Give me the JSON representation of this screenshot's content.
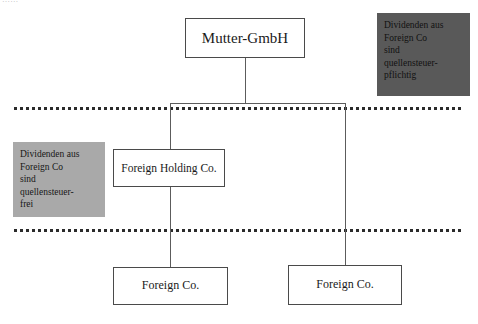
{
  "diagram": {
    "top_fragment_text": "……",
    "entities": [
      {
        "id": "mutter",
        "label": "Mutter-GmbH"
      },
      {
        "id": "holding",
        "label": "Foreign Holding Co."
      },
      {
        "id": "foreign_left",
        "label": "Foreign Co."
      },
      {
        "id": "foreign_right",
        "label": "Foreign Co."
      }
    ],
    "notes": [
      {
        "id": "withholding_taxable",
        "text": "Dividenden aus\nForeign Co\nsind\nquellensteuer-\npflichtig",
        "background": "#595959"
      },
      {
        "id": "withholding_free",
        "text": "Dividenden aus\nForeign Co\nsind\nquellensteuer-\nfrei",
        "background": "#a9a9a9"
      }
    ],
    "colors": {
      "box_border": "#4a4a4a",
      "connector": "#5c5c5c",
      "boundary_line": "#2b2b2b",
      "canvas": "#ffffff"
    }
  }
}
